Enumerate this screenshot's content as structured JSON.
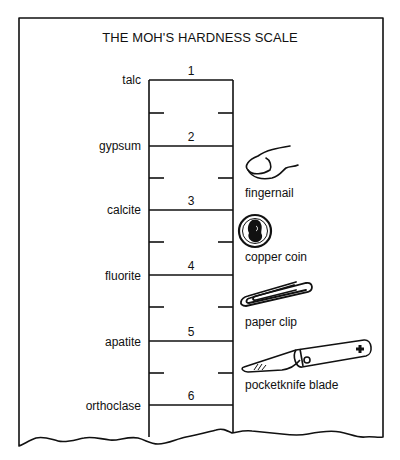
{
  "title": "THE MOH'S HARDNESS SCALE",
  "scale": {
    "levels": [
      {
        "number": "1",
        "mineral": "talc"
      },
      {
        "number": "2",
        "mineral": "gypsum"
      },
      {
        "number": "3",
        "mineral": "calcite"
      },
      {
        "number": "4",
        "mineral": "fluorite"
      },
      {
        "number": "5",
        "mineral": "apatite"
      },
      {
        "number": "6",
        "mineral": "orthoclase"
      }
    ]
  },
  "tools": [
    {
      "label": "fingernail",
      "icon": "fingernail-icon"
    },
    {
      "label": "copper coin",
      "icon": "copper-coin-icon"
    },
    {
      "label": "paper clip",
      "icon": "paper-clip-icon"
    },
    {
      "label": "pocketknife blade",
      "icon": "pocketknife-icon"
    }
  ],
  "colors": {
    "ink": "#111111",
    "paper": "#ffffff"
  }
}
